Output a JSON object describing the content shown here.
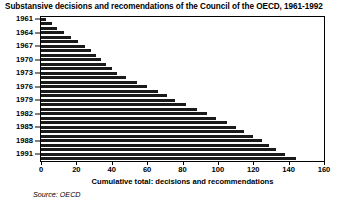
{
  "chart_data": {
    "type": "bar",
    "orientation": "horizontal",
    "title": "Substansive decisions and recomendations of the Council of the OECD, 1961-1992",
    "xlabel": "Cumulative total: decisions and recommendations",
    "ylabel": "",
    "xlim": [
      0,
      160
    ],
    "xticks": [
      0,
      20,
      40,
      60,
      80,
      100,
      120,
      140,
      160
    ],
    "yticks": [
      "1961",
      "1964",
      "1967",
      "1970",
      "1973",
      "1976",
      "1979",
      "1982",
      "1985",
      "1988",
      "1991"
    ],
    "grid": false,
    "legend": false,
    "bar_color": "#1a1a1a",
    "categories": [
      "1961",
      "1962",
      "1963",
      "1964",
      "1965",
      "1966",
      "1967",
      "1968",
      "1969",
      "1970",
      "1971",
      "1972",
      "1973",
      "1974",
      "1975",
      "1976",
      "1977",
      "1978",
      "1979",
      "1980",
      "1981",
      "1982",
      "1983",
      "1984",
      "1985",
      "1986",
      "1987",
      "1988",
      "1989",
      "1990",
      "1991",
      "1992"
    ],
    "values": [
      3,
      6,
      9,
      13,
      17,
      21,
      25,
      28,
      31,
      34,
      37,
      40,
      43,
      48,
      54,
      60,
      66,
      71,
      76,
      82,
      88,
      94,
      99,
      105,
      110,
      115,
      120,
      125,
      129,
      133,
      138,
      144
    ]
  },
  "source": {
    "label": "Source: OECD"
  }
}
